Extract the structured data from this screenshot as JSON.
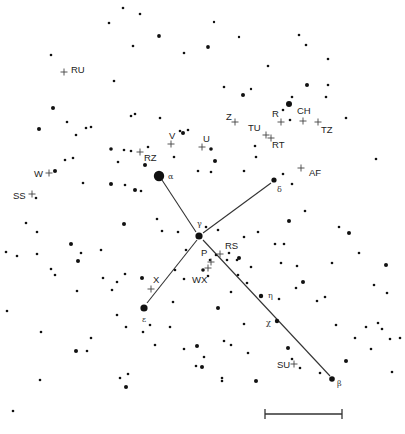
{
  "colors": {
    "ink": "#111111",
    "line": "#333333",
    "cross": "#444444",
    "background": "#ffffff"
  },
  "bright_stars": [
    {
      "id": "alpha",
      "label": "α",
      "x": 159,
      "y": 176,
      "r": 5.2,
      "lx": 168,
      "ly": 179
    },
    {
      "id": "gamma",
      "label": "γ",
      "x": 199,
      "y": 236,
      "r": 3.6,
      "lx": 197,
      "ly": 226
    },
    {
      "id": "delta",
      "label": "δ",
      "x": 274,
      "y": 180,
      "r": 2.6,
      "lx": 277,
      "ly": 192
    },
    {
      "id": "epsilon",
      "label": "ε",
      "x": 144,
      "y": 308,
      "r": 3.6,
      "lx": 142,
      "ly": 322
    },
    {
      "id": "eta",
      "label": "η",
      "x": 261,
      "y": 296,
      "r": 2.2,
      "lx": 268,
      "ly": 298
    },
    {
      "id": "chi",
      "label": "χ",
      "x": 277,
      "y": 321,
      "r": 2.2,
      "lx": 266,
      "ly": 325
    },
    {
      "id": "beta",
      "label": "β",
      "x": 332,
      "y": 379,
      "r": 2.8,
      "lx": 337,
      "ly": 386
    }
  ],
  "lines": [
    {
      "from": "alpha",
      "to": "gamma",
      "x1": 162,
      "y1": 180,
      "x2": 196,
      "y2": 232
    },
    {
      "from": "gamma",
      "to": "delta",
      "x1": 203,
      "y1": 233,
      "x2": 271,
      "y2": 183
    },
    {
      "from": "gamma",
      "to": "epsilon",
      "x1": 197,
      "y1": 240,
      "x2": 147,
      "y2": 303
    },
    {
      "from": "gamma",
      "to": "beta",
      "x1": 203,
      "y1": 240,
      "x2": 330,
      "y2": 376
    }
  ],
  "variable_stars": [
    {
      "label": "RU",
      "x": 64,
      "y": 72,
      "lx": 71,
      "ly": 73
    },
    {
      "label": "Z",
      "x": 235,
      "y": 122,
      "lx": 226,
      "ly": 120
    },
    {
      "label": "R",
      "x": 281,
      "y": 122,
      "lx": 272,
      "ly": 117
    },
    {
      "label": "CH",
      "x": 303,
      "y": 121,
      "lx": 297,
      "ly": 114
    },
    {
      "label": "TZ",
      "x": 318,
      "y": 122,
      "lx": 321,
      "ly": 133
    },
    {
      "label": "TU",
      "x": 266,
      "y": 135,
      "lx": 248,
      "ly": 131
    },
    {
      "label": "RT",
      "x": 271,
      "y": 138,
      "lx": 272,
      "ly": 148
    },
    {
      "label": "V",
      "x": 171,
      "y": 144,
      "lx": 169,
      "ly": 139
    },
    {
      "label": "U",
      "x": 202,
      "y": 147,
      "lx": 203,
      "ly": 142
    },
    {
      "label": "RZ",
      "x": 140,
      "y": 152,
      "lx": 144,
      "ly": 161
    },
    {
      "label": "AF",
      "x": 301,
      "y": 168,
      "lx": 309,
      "ly": 176
    },
    {
      "label": "W",
      "x": 49,
      "y": 173,
      "lx": 34,
      "ly": 177
    },
    {
      "label": "SS",
      "x": 32,
      "y": 194,
      "lx": 13,
      "ly": 199
    },
    {
      "label": "RS",
      "x": 220,
      "y": 254,
      "lx": 225,
      "ly": 249
    },
    {
      "label": "P",
      "x": 211,
      "y": 262,
      "lx": 201,
      "ly": 256
    },
    {
      "label": "WX",
      "x": 208,
      "y": 268,
      "lx": 192,
      "ly": 283
    },
    {
      "label": "X",
      "x": 151,
      "y": 289,
      "lx": 153,
      "ly": 283
    },
    {
      "label": "SU",
      "x": 294,
      "y": 364,
      "lx": 277,
      "ly": 368
    }
  ],
  "stars": [
    [
      123,
      8,
      1.3
    ],
    [
      140,
      14,
      1.3
    ],
    [
      109,
      23,
      1.3
    ],
    [
      159,
      36,
      1.9
    ],
    [
      133,
      46,
      1.3
    ],
    [
      184,
      53,
      1.3
    ],
    [
      51,
      55,
      1.3
    ],
    [
      214,
      22,
      1.2
    ],
    [
      239,
      37,
      1.2
    ],
    [
      299,
      35,
      1.3
    ],
    [
      306,
      45,
      1.3
    ],
    [
      208,
      47,
      1.9
    ],
    [
      328,
      59,
      1.3
    ],
    [
      268,
      66,
      1.3
    ],
    [
      114,
      81,
      1.3
    ],
    [
      224,
      87,
      1.3
    ],
    [
      251,
      89,
      1.2
    ],
    [
      243,
      95,
      2.0
    ],
    [
      307,
      85,
      2.0
    ],
    [
      328,
      85,
      1.3
    ],
    [
      326,
      97,
      1.3
    ],
    [
      53,
      108,
      2.0
    ],
    [
      131,
      116,
      1.3
    ],
    [
      135,
      114,
      1.3
    ],
    [
      160,
      118,
      1.3
    ],
    [
      292,
      97,
      1.3
    ],
    [
      289,
      104,
      3.0
    ],
    [
      283,
      110,
      1.3
    ],
    [
      290,
      120,
      1.3
    ],
    [
      346,
      118,
      1.3
    ],
    [
      39,
      129,
      2.0
    ],
    [
      67,
      122,
      1.3
    ],
    [
      76,
      135,
      1.3
    ],
    [
      86,
      128,
      1.3
    ],
    [
      91,
      127,
      1.3
    ],
    [
      180,
      131,
      1.3
    ],
    [
      183,
      133,
      2.0
    ],
    [
      188,
      130,
      1.3
    ],
    [
      111,
      149,
      1.8
    ],
    [
      124,
      150,
      1.3
    ],
    [
      131,
      151,
      1.3
    ],
    [
      148,
      147,
      1.3
    ],
    [
      211,
      149,
      1.8
    ],
    [
      145,
      165,
      2.0
    ],
    [
      118,
      162,
      1.3
    ],
    [
      174,
      157,
      1.3
    ],
    [
      215,
      161,
      2.0
    ],
    [
      255,
      146,
      1.3
    ],
    [
      256,
      157,
      1.3
    ],
    [
      55,
      171,
      2.0
    ],
    [
      65,
      160,
      1.3
    ],
    [
      73,
      158,
      1.3
    ],
    [
      198,
      171,
      1.3
    ],
    [
      211,
      172,
      1.3
    ],
    [
      244,
      171,
      1.3
    ],
    [
      283,
      174,
      1.3
    ],
    [
      292,
      184,
      1.3
    ],
    [
      376,
      159,
      1.3
    ],
    [
      36,
      198,
      1.3
    ],
    [
      83,
      183,
      1.3
    ],
    [
      111,
      184,
      2.0
    ],
    [
      125,
      185,
      1.3
    ],
    [
      135,
      190,
      2.0
    ],
    [
      141,
      191,
      1.3
    ],
    [
      124,
      224,
      2.0
    ],
    [
      157,
      219,
      1.3
    ],
    [
      162,
      231,
      1.3
    ],
    [
      178,
      232,
      1.3
    ],
    [
      218,
      230,
      1.3
    ],
    [
      244,
      237,
      1.3
    ],
    [
      289,
      221,
      2.0
    ],
    [
      305,
      211,
      1.3
    ],
    [
      339,
      227,
      1.3
    ],
    [
      349,
      233,
      2.0
    ],
    [
      332,
      263,
      1.3
    ],
    [
      26,
      223,
      1.3
    ],
    [
      37,
      232,
      1.3
    ],
    [
      6,
      252,
      1.3
    ],
    [
      17,
      256,
      1.3
    ],
    [
      37,
      254,
      1.3
    ],
    [
      71,
      244,
      2.0
    ],
    [
      78,
      261,
      2.0
    ],
    [
      81,
      253,
      1.3
    ],
    [
      101,
      250,
      1.3
    ],
    [
      51,
      269,
      1.3
    ],
    [
      55,
      275,
      1.3
    ],
    [
      77,
      291,
      1.3
    ],
    [
      103,
      278,
      1.3
    ],
    [
      206,
      227,
      1.3
    ],
    [
      210,
      260,
      1.3
    ],
    [
      216,
      255,
      1.3
    ],
    [
      227,
      260,
      1.3
    ],
    [
      229,
      253,
      1.3
    ],
    [
      258,
      232,
      1.3
    ],
    [
      275,
      244,
      1.3
    ],
    [
      284,
      244,
      1.3
    ],
    [
      297,
      266,
      1.3
    ],
    [
      281,
      263,
      1.3
    ],
    [
      359,
      253,
      1.3
    ],
    [
      386,
      265,
      2.0
    ],
    [
      303,
      282,
      2.0
    ],
    [
      296,
      288,
      1.3
    ],
    [
      325,
      297,
      1.3
    ],
    [
      374,
      285,
      1.3
    ],
    [
      387,
      293,
      1.3
    ],
    [
      239,
      258,
      2.0
    ],
    [
      237,
      260,
      1.3
    ],
    [
      238,
      275,
      1.3
    ],
    [
      251,
      267,
      1.3
    ],
    [
      279,
      299,
      1.3
    ],
    [
      203,
      270,
      1.8
    ],
    [
      208,
      276,
      1.3
    ],
    [
      175,
      270,
      1.3
    ],
    [
      184,
      279,
      1.3
    ],
    [
      247,
      283,
      1.3
    ],
    [
      231,
      292,
      1.3
    ],
    [
      218,
      308,
      2.0
    ],
    [
      224,
      341,
      1.3
    ],
    [
      244,
      324,
      1.3
    ],
    [
      186,
      250,
      1.3
    ],
    [
      117,
      282,
      1.3
    ],
    [
      125,
      274,
      1.3
    ],
    [
      112,
      290,
      1.3
    ],
    [
      142,
      278,
      2.0
    ],
    [
      173,
      302,
      1.3
    ],
    [
      170,
      327,
      1.3
    ],
    [
      117,
      315,
      1.3
    ],
    [
      150,
      325,
      1.3
    ],
    [
      143,
      332,
      1.3
    ],
    [
      126,
      327,
      1.3
    ],
    [
      91,
      338,
      1.3
    ],
    [
      76,
      351,
      2.0
    ],
    [
      87,
      351,
      1.3
    ],
    [
      40,
      380,
      1.3
    ],
    [
      155,
      345,
      1.3
    ],
    [
      184,
      349,
      1.3
    ],
    [
      197,
      346,
      2.0
    ],
    [
      196,
      366,
      1.3
    ],
    [
      204,
      357,
      1.3
    ],
    [
      231,
      345,
      1.3
    ],
    [
      248,
      353,
      1.3
    ],
    [
      222,
      378,
      1.3
    ],
    [
      256,
      381,
      2.0
    ],
    [
      288,
      348,
      2.0
    ],
    [
      292,
      359,
      1.3
    ],
    [
      300,
      368,
      1.3
    ],
    [
      320,
      373,
      1.3
    ],
    [
      346,
      361,
      2.0
    ],
    [
      317,
      301,
      1.3
    ],
    [
      336,
      325,
      1.3
    ],
    [
      382,
      329,
      1.3
    ],
    [
      390,
      339,
      1.3
    ],
    [
      400,
      338,
      1.3
    ],
    [
      371,
      349,
      1.3
    ],
    [
      392,
      372,
      1.3
    ],
    [
      120,
      378,
      1.3
    ],
    [
      128,
      374,
      1.3
    ],
    [
      126,
      387,
      2.0
    ],
    [
      202,
      367,
      2.0
    ],
    [
      222,
      381,
      1.3
    ],
    [
      378,
      323,
      1.3
    ],
    [
      355,
      338,
      1.3
    ],
    [
      366,
      327,
      1.3
    ],
    [
      7,
      311,
      1.3
    ],
    [
      41,
      332,
      1.3
    ],
    [
      13,
      411,
      1.3
    ]
  ],
  "scale_bar": {
    "x1": 265,
    "x2": 342,
    "y": 414,
    "tick": 5
  }
}
